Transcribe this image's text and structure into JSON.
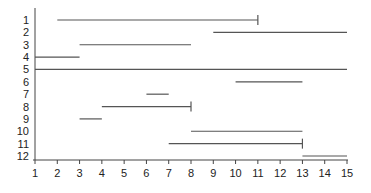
{
  "chart_data": {
    "type": "interval",
    "title": "",
    "xlabel": "",
    "ylabel": "",
    "xlim": [
      1,
      15
    ],
    "ylim": [
      1,
      12
    ],
    "y_inverted": true,
    "grid": false,
    "x_ticks": [
      1,
      2,
      3,
      4,
      5,
      6,
      7,
      8,
      9,
      10,
      11,
      12,
      13,
      14,
      15
    ],
    "y_ticks": [
      1,
      2,
      3,
      4,
      5,
      6,
      7,
      8,
      9,
      10,
      11,
      12
    ],
    "segments": [
      {
        "row": 1,
        "start": 2,
        "end": 11,
        "end_tick": true
      },
      {
        "row": 2,
        "start": 9,
        "end": 15,
        "end_tick": false
      },
      {
        "row": 3,
        "start": 3,
        "end": 8,
        "end_tick": false
      },
      {
        "row": 4,
        "start": 1,
        "end": 3,
        "end_tick": false
      },
      {
        "row": 5,
        "start": 1,
        "end": 15,
        "end_tick": false
      },
      {
        "row": 6,
        "start": 10,
        "end": 13,
        "end_tick": false
      },
      {
        "row": 7,
        "start": 6,
        "end": 7,
        "end_tick": false
      },
      {
        "row": 8,
        "start": 4,
        "end": 8,
        "end_tick": true
      },
      {
        "row": 9,
        "start": 3,
        "end": 4,
        "end_tick": false
      },
      {
        "row": 10,
        "start": 8,
        "end": 13,
        "end_tick": false
      },
      {
        "row": 11,
        "start": 7,
        "end": 13,
        "end_tick": true
      },
      {
        "row": 12,
        "start": 13,
        "end": 15,
        "end_tick": false
      }
    ],
    "colors": {
      "line": "#555555",
      "axis": "#444444",
      "text": "#222222"
    }
  }
}
